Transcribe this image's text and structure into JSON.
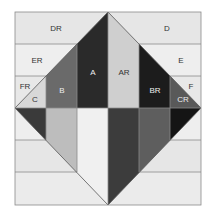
{
  "diagram": {
    "title": "",
    "colors": {
      "band_light": "#e4e4e4",
      "band_lighter": "#eeeeee",
      "line": "#8a8a8a",
      "A": "#2a2a2a",
      "AR": "#cfcfcf",
      "B": "#6a6a6a",
      "BR": "#1c1c1c",
      "C": "#d8d8d8",
      "CR": "#595959",
      "low_l1": "#3a3a3a",
      "low_l2": "#bdbdbd",
      "low_l3": "#f0f0f0",
      "low_r1": "#3c3c3c",
      "low_r2": "#5e5e5e",
      "low_r3": "#151515"
    },
    "labels": {
      "DR": "DR",
      "D": "D",
      "ER": "ER",
      "E": "E",
      "FR": "FR",
      "F": "F",
      "A": "A",
      "AR": "AR",
      "B": "B",
      "BR": "BR",
      "C": "C",
      "CR": "CR"
    }
  }
}
